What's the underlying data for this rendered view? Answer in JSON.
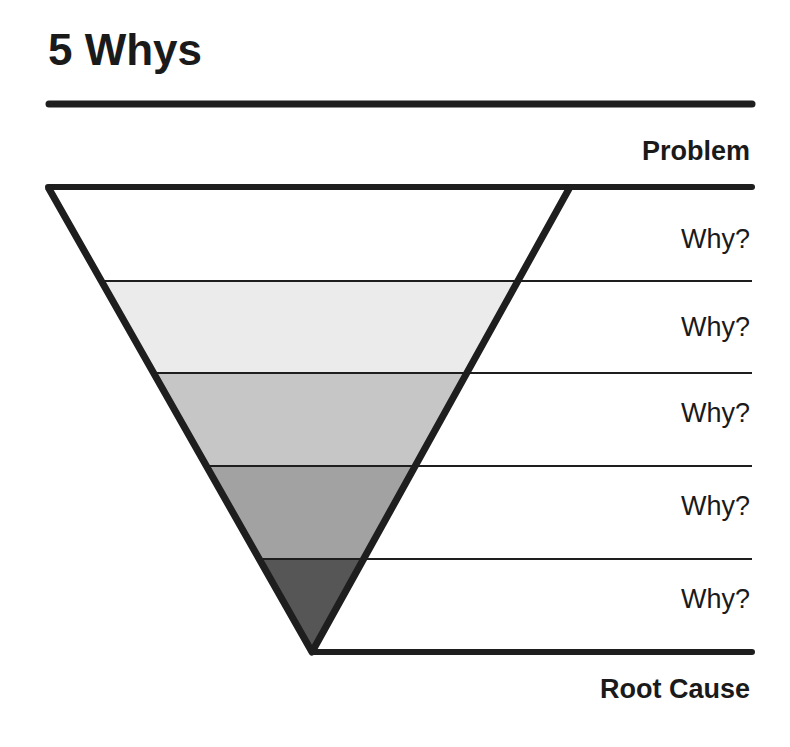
{
  "title": "5 Whys",
  "top_label": "Problem",
  "bottom_label": "Root Cause",
  "levels": [
    {
      "label": "Why?",
      "fill": "#ffffff"
    },
    {
      "label": "Why?",
      "fill": "#ebebeb"
    },
    {
      "label": "Why?",
      "fill": "#c6c6c6"
    },
    {
      "label": "Why?",
      "fill": "#a2a2a2"
    },
    {
      "label": "Why?",
      "fill": "#565656"
    }
  ],
  "colors": {
    "stroke": "#1e1e1e",
    "background": "#ffffff"
  }
}
